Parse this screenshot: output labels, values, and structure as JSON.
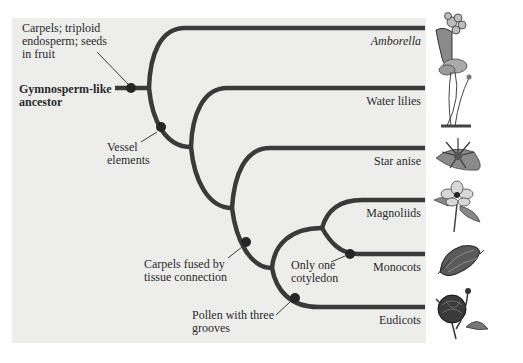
{
  "diagram": {
    "type": "phylogenetic-tree",
    "root": {
      "label_line1": "Gymnosperm-like",
      "label_line2": "ancestor"
    },
    "taxa": [
      {
        "name": "Amborella",
        "italic": true,
        "plant_icon": "amborella-flower-icon"
      },
      {
        "name": "Water lilies",
        "italic": false,
        "plant_icon": "water-lily-icon"
      },
      {
        "name": "Star anise",
        "italic": false,
        "plant_icon": "star-anise-icon"
      },
      {
        "name": "Magnoliids",
        "italic": false,
        "plant_icon": "magnolia-flower-icon"
      },
      {
        "name": "Monocots",
        "italic": false,
        "plant_icon": "corn-ear-icon"
      },
      {
        "name": "Eudicots",
        "italic": false,
        "plant_icon": "rose-flower-icon"
      }
    ],
    "traits": [
      {
        "line1": "Carpels; triploid",
        "line2": "endosperm; seeds",
        "line3": "in fruit"
      },
      {
        "line1": "Vessel",
        "line2": "elements"
      },
      {
        "line1": "Carpels fused by",
        "line2": "tissue connection"
      },
      {
        "line1": "Only one",
        "line2": "cotyledon"
      },
      {
        "line1": "Pollen with three",
        "line2": "grooves"
      }
    ],
    "colors": {
      "panel": "#ededec",
      "branch": "#3a3a3a",
      "node": "#262626",
      "text": "#2b2b2b"
    }
  }
}
